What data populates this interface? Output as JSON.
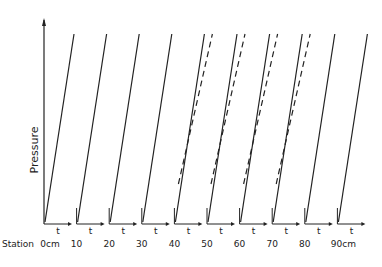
{
  "chart_data": {
    "type": "line",
    "title": "",
    "ylabel": "Pressure",
    "xlabel": "t",
    "station_prefix": "Station",
    "stations": [
      "0cm",
      "10",
      "20",
      "30",
      "40",
      "50",
      "60",
      "70",
      "80",
      "90cm"
    ],
    "station_positions_cm": [
      0,
      10,
      20,
      30,
      40,
      50,
      60,
      70,
      80,
      90
    ],
    "series": [
      {
        "name": "solid",
        "style": "solid",
        "present_at": [
          0,
          10,
          20,
          30,
          40,
          50,
          60,
          70,
          80,
          90
        ]
      },
      {
        "name": "dashed",
        "style": "dashed",
        "present_at": [
          40,
          50,
          60,
          70
        ]
      }
    ],
    "grid": false,
    "legend": null
  },
  "labels": {
    "y_axis": "Pressure",
    "station_word": "Station",
    "time_symbol": "t"
  },
  "colors": {
    "ink": "#222222",
    "background": "#ffffff"
  }
}
